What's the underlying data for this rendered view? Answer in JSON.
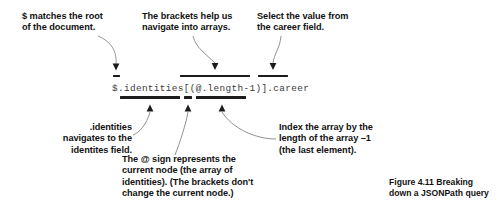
{
  "figure": {
    "background_color": "#ffffff",
    "ink_color": "#1c1c1c",
    "leader_color": "#6e6e6e",
    "code_color": "#3a3a3a",
    "query": "$.identities[(@.length-1)].career",
    "caption": "Figure 4.11   Breaking\ndown a JSONPath query",
    "callouts": {
      "root": "$ matches the root\nof the document.",
      "brackets": "The brackets help us\nnavigate into arrays.",
      "career": "Select the value from\nthe career field.",
      "identities": ".identities\nnavigates to the\nidentites field.",
      "at_sign": "The @ sign represents the\ncurrent node (the array of\nidentities). (The brackets don't\nchange the current node.)",
      "index": "Index the array by the\nlength of the array –1\n(the last element)."
    },
    "underline_segments": [
      {
        "id": "root-bar",
        "label": "$",
        "position": "above",
        "x": 113,
        "y": 75,
        "width": 7
      },
      {
        "id": "brackets-bar",
        "label": "[(@.length-1)]",
        "position": "above",
        "x": 180,
        "y": 74.5,
        "width": 70
      },
      {
        "id": "career-bar",
        "label": ".career",
        "position": "above",
        "x": 258,
        "y": 74.5,
        "width": 30
      },
      {
        "id": "identities-bar",
        "label": ".identities",
        "position": "below",
        "x": 120,
        "y": 96,
        "width": 60
      },
      {
        "id": "at-bar",
        "label": "@",
        "position": "below",
        "x": 184,
        "y": 96,
        "width": 8
      },
      {
        "id": "length-bar",
        "label": ".length-1",
        "position": "below",
        "x": 196,
        "y": 96,
        "width": 50
      }
    ]
  }
}
